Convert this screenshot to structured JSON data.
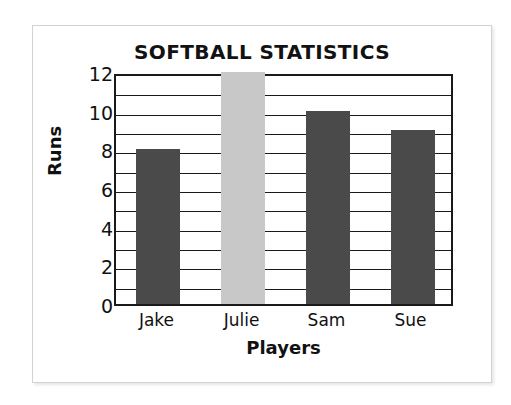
{
  "chart_data": {
    "type": "bar",
    "title": "SOFTBALL STATISTICS",
    "xlabel": "Players",
    "ylabel": "Runs",
    "categories": [
      "Jake",
      "Julie",
      "Sam",
      "Sue"
    ],
    "values": [
      8,
      12,
      10,
      9
    ],
    "bar_colors": [
      "#4a4a4a",
      "#c8c8c8",
      "#4a4a4a",
      "#4a4a4a"
    ],
    "ylim": [
      0,
      12
    ],
    "ytick_labels": [
      "0",
      "2",
      "4",
      "6",
      "8",
      "10",
      "12"
    ],
    "ytick_values": [
      0,
      2,
      4,
      6,
      8,
      10,
      12
    ],
    "gridlines": true,
    "gridline_interval": 1,
    "gridline_values": [
      1,
      2,
      3,
      4,
      5,
      6,
      7,
      8,
      9,
      10,
      11
    ],
    "legend": null,
    "axis_color": "#1a1a1a",
    "background_color": "#ffffff",
    "frame_color": "#d2d2d2"
  }
}
